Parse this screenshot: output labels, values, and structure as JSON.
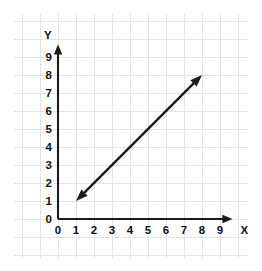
{
  "chart_data": {
    "type": "line",
    "title": "",
    "subtitle": "",
    "xlabel": "X",
    "ylabel": "Y",
    "xlim": [
      0,
      9.8
    ],
    "ylim": [
      0,
      9.8
    ],
    "xticks": [
      "0",
      "1",
      "2",
      "3",
      "4",
      "5",
      "6",
      "7",
      "8",
      "9"
    ],
    "yticks": [
      "0",
      "1",
      "2",
      "3",
      "4",
      "5",
      "6",
      "7",
      "8",
      "9"
    ],
    "xtick_values": [
      0,
      1,
      2,
      3,
      4,
      5,
      6,
      7,
      8,
      9
    ],
    "ytick_values": [
      0,
      1,
      2,
      3,
      4,
      5,
      6,
      7,
      8,
      9
    ],
    "grid": true,
    "grid_color": "#e3e3e3",
    "background": "#ffffff",
    "legend": null,
    "legend_position": "none",
    "annotations": [],
    "series": [
      {
        "name": "line-segment",
        "style": "double-headed-arrow",
        "color": "#141414",
        "equation": "y = x",
        "slope": 1,
        "intercept": 0,
        "x": [
          1,
          8
        ],
        "values": [
          1,
          8
        ],
        "points": [
          {
            "x": 1,
            "y": 1
          },
          {
            "x": 8,
            "y": 8
          }
        ],
        "arrow_start": true,
        "arrow_end": true
      }
    ],
    "axis_arrows": {
      "x_axis_arrow": true,
      "y_axis_arrow": true,
      "axis_color": "#1a1a1a"
    }
  },
  "labels": {
    "x_axis_title": "X",
    "y_axis_title": "Y"
  }
}
